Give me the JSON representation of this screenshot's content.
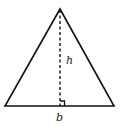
{
  "diagram": {
    "labels": {
      "height": "h",
      "base": "b"
    },
    "colors": {
      "stroke": "#111111",
      "background": "#ffffff"
    }
  }
}
